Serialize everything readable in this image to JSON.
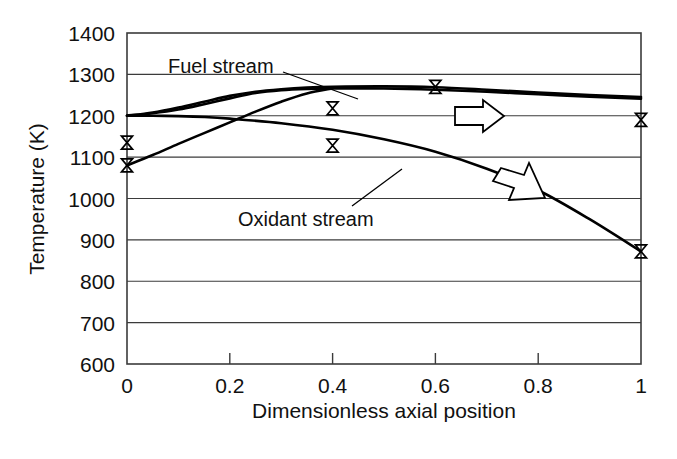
{
  "chart_data": {
    "type": "line",
    "title": "",
    "xlabel": "Dimensionless axial position",
    "ylabel": "Temperature (K)",
    "xlim": [
      0,
      1
    ],
    "ylim": [
      600,
      1400
    ],
    "grid": true,
    "legend_position": "inline-annotation",
    "x_ticks": [
      "0",
      "0.2",
      "0.4",
      "0.6",
      "0.8",
      "1"
    ],
    "x_tick_values": [
      0,
      0.2,
      0.4,
      0.6,
      0.8,
      1
    ],
    "y_ticks": [
      "600",
      "700",
      "800",
      "900",
      "1000",
      "1100",
      "1200",
      "1300",
      "1400"
    ],
    "y_tick_values": [
      600,
      700,
      800,
      900,
      1000,
      1100,
      1200,
      1300,
      1400
    ],
    "annotations": [
      {
        "name": "fuel-stream-label",
        "text": "Fuel stream",
        "x": 0.13,
        "y": 1325
      },
      {
        "name": "oxidant-stream-label",
        "text": "Oxidant stream",
        "x": 0.36,
        "y": 1010
      },
      {
        "name": "fuel-arrow",
        "text": "",
        "direction": "right",
        "x": 0.66,
        "y": 1205
      },
      {
        "name": "oxidant-arrow",
        "text": "",
        "direction": "up-left",
        "x": 0.78,
        "y": 1060
      }
    ],
    "series": [
      {
        "name": "Fuel stream",
        "marker": "x-bowtie",
        "x": [
          0.0,
          0.05,
          0.1,
          0.15,
          0.2,
          0.25,
          0.3,
          0.35,
          0.4,
          0.5,
          0.6,
          0.7,
          0.8,
          0.9,
          1.0
        ],
        "values": [
          1200,
          1206,
          1215,
          1228,
          1242,
          1255,
          1262,
          1265,
          1266,
          1266,
          1263,
          1258,
          1252,
          1246,
          1241
        ],
        "data_points": [
          {
            "x": 0.0,
            "y": 1135
          },
          {
            "x": 0.4,
            "y": 1218
          },
          {
            "x": 0.6,
            "y": 1270
          },
          {
            "x": 1.0,
            "y": 1190
          }
        ]
      },
      {
        "name": "Fuel stream secondary",
        "marker": "none",
        "x": [
          0.0,
          0.05,
          0.1,
          0.15,
          0.2,
          0.25,
          0.3,
          0.35,
          0.4,
          0.5,
          0.6,
          0.7,
          0.8,
          0.9,
          1.0
        ],
        "values": [
          1200,
          1208,
          1220,
          1234,
          1248,
          1258,
          1264,
          1268,
          1270,
          1271,
          1269,
          1263,
          1256,
          1250,
          1245
        ]
      },
      {
        "name": "Oxidant stream",
        "marker": "x-bowtie",
        "x": [
          0.0,
          0.05,
          0.1,
          0.15,
          0.2,
          0.3,
          0.4,
          0.5,
          0.6,
          0.7,
          0.8,
          0.9,
          1.0
        ],
        "values": [
          1200,
          1200,
          1199,
          1197,
          1193,
          1182,
          1166,
          1143,
          1113,
          1072,
          1020,
          950,
          872
        ],
        "data_points": [
          {
            "x": 0.0,
            "y": 1080
          },
          {
            "x": 0.4,
            "y": 1128
          },
          {
            "x": 1.0,
            "y": 872
          }
        ]
      },
      {
        "name": "Oxidant stream rising",
        "marker": "none",
        "x": [
          0.0,
          0.05,
          0.1,
          0.15,
          0.2,
          0.25,
          0.3,
          0.35,
          0.4
        ],
        "values": [
          1080,
          1105,
          1132,
          1158,
          1184,
          1210,
          1234,
          1254,
          1266
        ]
      }
    ],
    "colors": {
      "curve": "#000000",
      "grid": "#3b3b3b",
      "frame": "#3b3b3b",
      "text": "#111111",
      "background": "#ffffff"
    }
  }
}
